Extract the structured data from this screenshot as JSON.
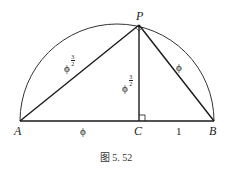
{
  "figure": {
    "caption": "图 5. 52",
    "points": {
      "A": {
        "label": "A",
        "x": 20,
        "y": 121
      },
      "B": {
        "label": "B",
        "x": 214,
        "y": 121
      },
      "C": {
        "label": "C",
        "x": 139,
        "y": 121
      },
      "P": {
        "label": "P",
        "x": 139,
        "y": 25
      }
    },
    "segments": {
      "AP": {
        "base": "ϕ",
        "exp_num": "3",
        "exp_den": "2"
      },
      "PC": {
        "base": "ϕ",
        "exp_num": "3",
        "exp_den": "2"
      },
      "PB": {
        "label": "ϕ"
      },
      "AC": {
        "label": "ϕ"
      },
      "CB": {
        "label": "1"
      }
    },
    "colors": {
      "stroke": "#1a1a1a",
      "arc": "#333333"
    }
  }
}
